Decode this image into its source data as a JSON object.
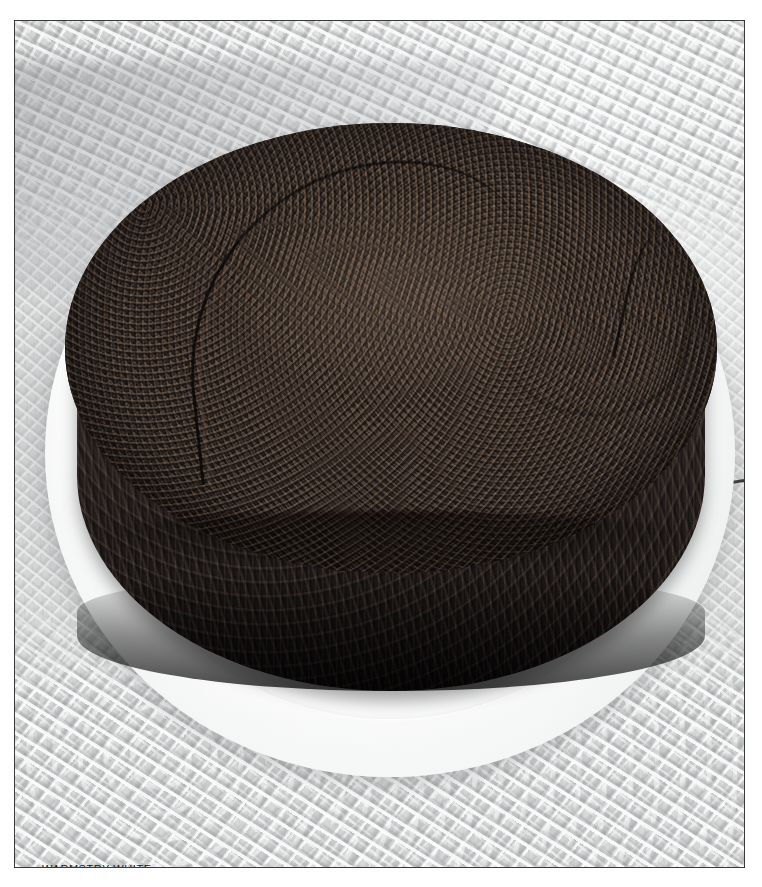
{
  "page": {
    "width": 762,
    "height": 887,
    "background_color": "#ffffff",
    "margin_color": "#ffffff"
  },
  "photo": {
    "border_color": "#3a3a3a",
    "left": 14,
    "top": 20,
    "width": 731,
    "height": 848,
    "subject": "dark chocolate cake on a white fluted plate",
    "alt_text": "A round dark brown crumbly-topped cake resting on a white fluted porcelain plate set on a white lace tablecloth"
  },
  "caption": {
    "text": "WARMSTRY WHITE",
    "color": "#1c1c1c",
    "font_size_px": 11,
    "transform": "uppercase",
    "position": {
      "left": 27,
      "top": 841
    }
  },
  "scene": {
    "elements": [
      {
        "name": "tablecloth",
        "label": "lace tablecloth",
        "color": "#e4e5e5"
      },
      {
        "name": "plate",
        "label": "white fluted plate",
        "color": "#fdfdfd"
      },
      {
        "name": "cake-top",
        "label": "crumbly cake top",
        "color": "#413630"
      },
      {
        "name": "cake-side",
        "label": "cake side wall",
        "color": "#241e1d"
      },
      {
        "name": "knife",
        "label": "knife blade edge",
        "color": "#37373a"
      },
      {
        "name": "shadow",
        "label": "cast shadow",
        "color": "#9a9d9f"
      }
    ]
  },
  "colors": {
    "cloth_light": "#f2f3f3",
    "cloth_mid": "#e2e3e3",
    "cloth_shadow": "#9a9d9f",
    "plate_white": "#ffffff",
    "plate_edge": "#d9dbdb",
    "cake_highlight": "#4a3e39",
    "cake_mid": "#342c29",
    "cake_dark": "#1b1616",
    "cake_deepest": "#120e0e",
    "frame_border": "#3a3a3a",
    "caption_text": "#1c1c1c"
  }
}
